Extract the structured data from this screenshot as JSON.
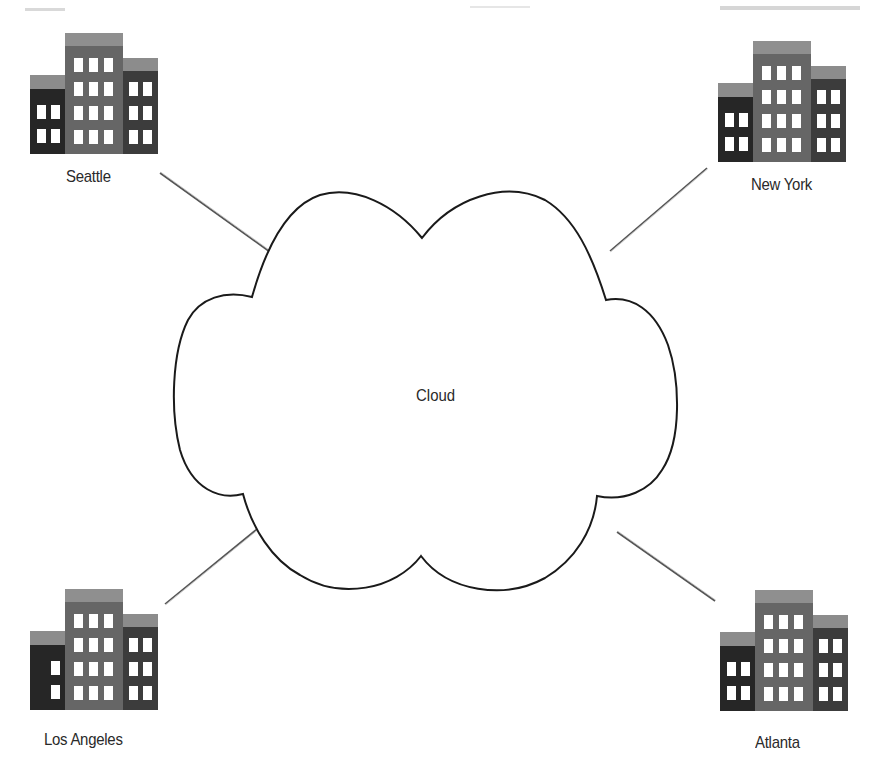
{
  "diagram": {
    "type": "network-topology",
    "center": {
      "label": "Cloud",
      "shape": "cloud"
    },
    "nodes": [
      {
        "id": "seattle",
        "label": "Seattle",
        "icon": "office-building-icon",
        "position": "top-left"
      },
      {
        "id": "new-york",
        "label": "New York",
        "icon": "office-building-icon",
        "position": "top-right"
      },
      {
        "id": "los-angeles",
        "label": "Los Angeles",
        "icon": "office-building-icon",
        "position": "bottom-left"
      },
      {
        "id": "atlanta",
        "label": "Atlanta",
        "icon": "office-building-icon",
        "position": "bottom-right"
      }
    ],
    "edges": [
      {
        "from": "seattle",
        "to": "cloud"
      },
      {
        "from": "new-york",
        "to": "cloud"
      },
      {
        "from": "los-angeles",
        "to": "cloud"
      },
      {
        "from": "atlanta",
        "to": "cloud"
      }
    ],
    "colors": {
      "building_dark": "#262626",
      "building_mid": "#5a5a5a",
      "building_roof": "#8a8a8a",
      "window": "#ffffff",
      "cloud_stroke": "#1a1a1a",
      "edge": "#6e6e6e",
      "text": "#2a2a2a"
    }
  }
}
